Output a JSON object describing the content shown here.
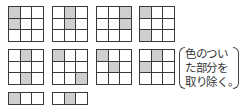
{
  "grids": [
    {
      "x": 8,
      "y": 6,
      "shaded": [
        [
          0,
          0
        ],
        [
          1,
          0
        ]
      ]
    },
    {
      "x": 52,
      "y": 6,
      "shaded": [
        [
          0,
          1
        ],
        [
          1,
          1
        ]
      ]
    },
    {
      "x": 96,
      "y": 6,
      "shaded": [
        [
          0,
          2
        ],
        [
          1,
          2
        ]
      ]
    },
    {
      "x": 139,
      "y": 6,
      "shaded": [
        [
          0,
          0
        ],
        [
          2,
          0
        ]
      ]
    },
    {
      "x": 8,
      "y": 49,
      "shaded": [
        [
          0,
          1
        ],
        [
          2,
          1
        ]
      ]
    },
    {
      "x": 52,
      "y": 49,
      "shaded": [
        [
          0,
          0
        ],
        [
          2,
          2
        ]
      ]
    },
    {
      "x": 96,
      "y": 49,
      "shaded": [
        [
          0,
          0
        ],
        [
          1,
          1
        ]
      ]
    },
    {
      "x": 139,
      "y": 49,
      "shaded": [
        [
          0,
          1
        ],
        [
          1,
          0
        ]
      ]
    },
    {
      "x": 8,
      "y": 92,
      "shaded": [
        [
          0,
          0
        ]
      ]
    },
    {
      "x": 52,
      "y": 92,
      "shaded": [
        [
          0,
          1
        ]
      ]
    }
  ],
  "note": {
    "lines": [
      "色のつい",
      "た部分を",
      "取り除く。"
    ]
  },
  "colors": {
    "shaded": "#cfcfcf",
    "line": "#3a3a3a"
  }
}
